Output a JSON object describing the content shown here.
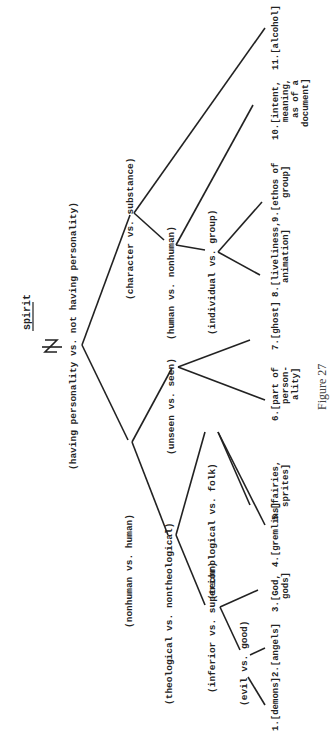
{
  "title": "spirit",
  "caption": "Figure 27",
  "nodes": {
    "root": "(having personality vs. not having personality)",
    "nonhuman_human": "(nonhuman vs. human)",
    "character_substance": "(character vs. substance)",
    "theological_nontheological": "(theological vs. nontheological)",
    "unseen_seen": "(unseen vs. seen)",
    "human_nonhuman": "(human vs. nonhuman)",
    "inferior_superior": "(inferior vs. superior)",
    "technological_folk": "(technological vs. folk)",
    "individual_group": "(individual vs. group)",
    "evil_good": "(evil vs. good)"
  },
  "leaves": [
    {
      "num": "1.",
      "lines": [
        "[demons]"
      ]
    },
    {
      "num": "2.",
      "lines": [
        "[angels]"
      ]
    },
    {
      "num": "3.",
      "lines": [
        "[God,",
        "gods]"
      ]
    },
    {
      "num": "4.",
      "lines": [
        "[gremlins]"
      ]
    },
    {
      "num": "5.",
      "lines": [
        "[fairies,",
        "sprites]"
      ]
    },
    {
      "num": "6.",
      "lines": [
        "[part of",
        "person-",
        "ality]"
      ]
    },
    {
      "num": "7.",
      "lines": [
        "[ghost]"
      ]
    },
    {
      "num": "8.",
      "lines": [
        "[liveliness,",
        "animation]"
      ]
    },
    {
      "num": "9.",
      "lines": [
        "[ethos of",
        "group]"
      ]
    },
    {
      "num": "10.",
      "lines": [
        "[intent,",
        "meaning,",
        "as of a",
        "document]"
      ]
    },
    {
      "num": "11.",
      "lines": [
        "[alcohol]"
      ]
    }
  ]
}
